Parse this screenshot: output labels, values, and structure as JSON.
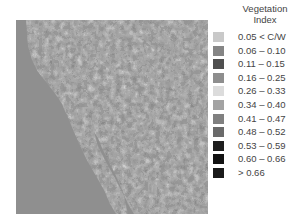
{
  "legend": {
    "title_line1": "Vegetation",
    "title_line2": "Index",
    "items": [
      {
        "label": "0.05 < C/W",
        "color": "#c9c9c9"
      },
      {
        "label": "0.06 – 0.10",
        "color": "#858585"
      },
      {
        "label": "0.11 – 0.15",
        "color": "#4f4f4f"
      },
      {
        "label": "0.16 – 0.25",
        "color": "#8e8e8e"
      },
      {
        "label": "0.26 – 0.33",
        "color": "#dcdcdc"
      },
      {
        "label": "0.34 – 0.40",
        "color": "#a3a3a3"
      },
      {
        "label": "0.41 – 0.47",
        "color": "#808080"
      },
      {
        "label": "0.48 – 0.52",
        "color": "#6a6a6a"
      },
      {
        "label": "0.53 – 0.59",
        "color": "#1e1e1e"
      },
      {
        "label": "0.60 – 0.66",
        "color": "#121212"
      },
      {
        "label": "> 0.66",
        "color": "#1a1a1a"
      }
    ]
  },
  "map": {
    "subject": "Vegetation index satellite map of Baja California / southwestern US region",
    "ocean_color": "#8f8f8f"
  }
}
